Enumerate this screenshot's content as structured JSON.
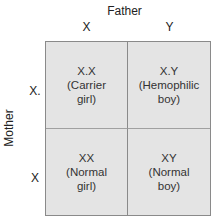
{
  "father": {
    "label": "Father",
    "alleles": [
      "X",
      "Y"
    ]
  },
  "mother": {
    "label": "Mother",
    "alleles": [
      "X.",
      "X"
    ]
  },
  "grid": {
    "cells": [
      {
        "genotype": "X.X",
        "line1": "(Carrier",
        "line2": "girl)"
      },
      {
        "genotype": "X.Y",
        "line1": "(Hemophilic",
        "line2": "boy)"
      },
      {
        "genotype": "XX",
        "line1": "(Normal",
        "line2": "girl)"
      },
      {
        "genotype": "XY",
        "line1": "(Normal",
        "line2": "boy)"
      }
    ],
    "colors": {
      "fill": "#e4e4e4",
      "border": "#8a8a8a"
    }
  }
}
